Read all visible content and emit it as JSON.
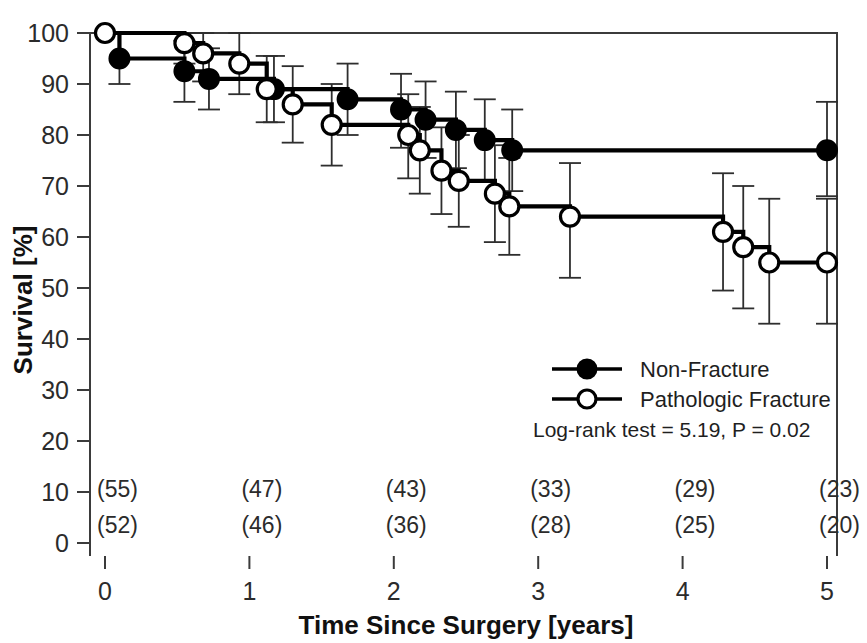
{
  "chart_data": {
    "type": "line",
    "title": "",
    "xlabel": "Time Since Surgery [years]",
    "ylabel": "Survival [%]",
    "xlim": [
      0,
      5
    ],
    "ylim": [
      0,
      100
    ],
    "xticks": [
      0,
      1,
      2,
      3,
      4,
      5
    ],
    "xticklabels": [
      "0",
      "1",
      "2",
      "3",
      "4",
      "5"
    ],
    "yticks": [
      0,
      10,
      20,
      30,
      40,
      50,
      60,
      70,
      80,
      90,
      100
    ],
    "yticklabels": [
      "0",
      "10",
      "20",
      "30",
      "40",
      "50",
      "60",
      "70",
      "80",
      "90",
      "100"
    ],
    "grid": false,
    "legend_position": "center-right",
    "annotation": "Log-rank test = 5.19, P = 0.02",
    "series": [
      {
        "name": "Non-Fracture",
        "marker": "filled-circle",
        "color": "#000000",
        "points": [
          {
            "x": 0.0,
            "y": 100,
            "marker": false
          },
          {
            "x": 0.1,
            "y": 95,
            "marker": true,
            "ci_low": 90,
            "ci_high": 100
          },
          {
            "x": 0.55,
            "y": 92.5,
            "marker": true,
            "ci_low": 86.5,
            "ci_high": 98.5
          },
          {
            "x": 0.72,
            "y": 91,
            "marker": true,
            "ci_low": 85,
            "ci_high": 97
          },
          {
            "x": 1.17,
            "y": 89,
            "marker": true,
            "ci_low": 82.5,
            "ci_high": 95.5
          },
          {
            "x": 1.68,
            "y": 87,
            "marker": true,
            "ci_low": 80,
            "ci_high": 94
          },
          {
            "x": 2.05,
            "y": 85,
            "marker": true,
            "ci_low": 77.5,
            "ci_high": 92
          },
          {
            "x": 2.22,
            "y": 83,
            "marker": true,
            "ci_low": 75.5,
            "ci_high": 90.5
          },
          {
            "x": 2.43,
            "y": 81,
            "marker": true,
            "ci_low": 73.5,
            "ci_high": 88.5
          },
          {
            "x": 2.63,
            "y": 79,
            "marker": true,
            "ci_low": 71,
            "ci_high": 87
          },
          {
            "x": 2.82,
            "y": 77,
            "marker": true,
            "ci_low": 69,
            "ci_high": 85
          },
          {
            "x": 5.0,
            "y": 77,
            "marker": true,
            "ci_low": 68,
            "ci_high": 86.5
          }
        ]
      },
      {
        "name": "Pathologic Fracture",
        "marker": "open-circle",
        "color": "#000000",
        "points": [
          {
            "x": 0.0,
            "y": 100,
            "marker": true
          },
          {
            "x": 0.55,
            "y": 98,
            "marker": true,
            "ci_low": 94,
            "ci_high": 100
          },
          {
            "x": 0.68,
            "y": 96,
            "marker": true,
            "ci_low": 90.5,
            "ci_high": 100
          },
          {
            "x": 0.93,
            "y": 94,
            "marker": true,
            "ci_low": 88,
            "ci_high": 100
          },
          {
            "x": 1.12,
            "y": 89,
            "marker": true,
            "ci_low": 82.5,
            "ci_high": 95.5
          },
          {
            "x": 1.3,
            "y": 86,
            "marker": true,
            "ci_low": 78.5,
            "ci_high": 93.5
          },
          {
            "x": 1.57,
            "y": 82,
            "marker": true,
            "ci_low": 74,
            "ci_high": 90
          },
          {
            "x": 2.1,
            "y": 80,
            "marker": true,
            "ci_low": 71.5,
            "ci_high": 88
          },
          {
            "x": 2.18,
            "y": 77,
            "marker": true,
            "ci_low": 68.5,
            "ci_high": 85.5
          },
          {
            "x": 2.33,
            "y": 73,
            "marker": true,
            "ci_low": 64.5,
            "ci_high": 81.5
          },
          {
            "x": 2.45,
            "y": 71,
            "marker": true,
            "ci_low": 62,
            "ci_high": 80
          },
          {
            "x": 2.7,
            "y": 68.5,
            "marker": true,
            "ci_low": 59,
            "ci_high": 78
          },
          {
            "x": 2.8,
            "y": 66,
            "marker": true,
            "ci_low": 56.5,
            "ci_high": 75.5
          },
          {
            "x": 3.22,
            "y": 64,
            "marker": true,
            "ci_low": 52,
            "ci_high": 74.5
          },
          {
            "x": 4.28,
            "y": 61,
            "marker": true,
            "ci_low": 49.5,
            "ci_high": 72.5
          },
          {
            "x": 4.42,
            "y": 58,
            "marker": true,
            "ci_low": 46,
            "ci_high": 70
          },
          {
            "x": 4.6,
            "y": 55,
            "marker": true,
            "ci_low": 43,
            "ci_high": 67.5
          },
          {
            "x": 5.0,
            "y": 55,
            "marker": true,
            "ci_low": 43,
            "ci_high": 67.5
          }
        ]
      }
    ],
    "at_risk": {
      "x_positions": [
        0,
        1,
        2,
        3,
        4,
        5
      ],
      "rows": [
        {
          "series": "Non-Fracture",
          "values": [
            "(55)",
            "(47)",
            "(43)",
            "(33)",
            "(29)",
            "(23)"
          ]
        },
        {
          "series": "Pathologic Fracture",
          "values": [
            "(52)",
            "(46)",
            "(36)",
            "(28)",
            "(25)",
            "(20)"
          ]
        }
      ]
    }
  },
  "legend": {
    "entries": [
      {
        "label": "Non-Fracture",
        "marker": "filled-circle"
      },
      {
        "label": "Pathologic Fracture",
        "marker": "open-circle"
      }
    ],
    "stat": "Log-rank test = 5.19, P = 0.02"
  }
}
